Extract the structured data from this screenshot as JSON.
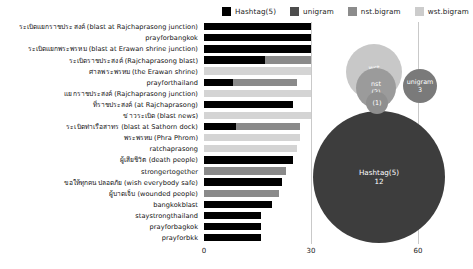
{
  "legend": {
    "items": [
      {
        "label": "Hashtag(5)",
        "color": "#000000",
        "icon": "legend-swatch-square"
      },
      {
        "label": "unigram",
        "color": "#4d4d4d",
        "icon": "legend-swatch-square"
      },
      {
        "label": "nst.bigram",
        "color": "#8c8c8c",
        "icon": "legend-swatch-square"
      },
      {
        "label": "wst.bigram",
        "color": "#cccccc",
        "icon": "legend-swatch-square"
      }
    ]
  },
  "chart_data": {
    "type": "bar",
    "orientation": "horizontal",
    "title": "",
    "xlabel": "",
    "ylabel": "",
    "xlim": [
      0,
      70
    ],
    "xticks": [
      0,
      30,
      60
    ],
    "xtick_labels": [
      "0",
      "30",
      "60"
    ],
    "grid": true,
    "legend_position": "top-right",
    "categories": [
      "ระเบิดแยกราชประสงค์ (blast at Rajchaprasong junction)",
      "prayforbangkok",
      "ระเบิดแยกพระพรหม (blast at Erawan shrine junction)",
      "ระเบิดราชประสงค์ (Rajchaprasong blast)",
      "ศาลพระพรหม (the Erawan shrine)",
      "prayforthailand",
      "แยกราชประสงค์ (Rajchaprasong junction)",
      "ที่ราชประสงค์ (at Rajchaprasong)",
      "ข่าวระเบิด (blast news)",
      "ระเบิดท่าเรือสาทร (blast at Sathorn dock)",
      "พระพรหม (Phra Phrom)",
      "ratchaprasong",
      "ผู้เสียชีวิต (death people)",
      "strongertogether",
      "ขอให้ทุกคนปลอดภัย (wish everybody safe)",
      "ผู้บาดเจ็บ (wounded people)",
      "bangkokblast",
      "staystrongthailand",
      "prayforbagkok",
      "prayforbkk"
    ],
    "values": [
      30,
      30,
      30,
      30,
      30,
      30,
      30,
      30,
      30,
      27,
      27,
      25,
      25,
      23,
      23,
      22,
      18,
      15,
      15,
      15
    ],
    "series_of_bar": [
      "wst.bigram",
      "Hashtag(5)",
      "wst.bigram",
      "wst.bigram",
      "nst.bigram",
      "Hashtag(5)",
      "nst.bigram",
      "wst.bigram",
      "wst.bigram",
      "Hashtag(5)",
      "unigram",
      "Hashtag(5)",
      "unigram",
      "Hashtag(5)",
      "Hashtag(5)",
      "unigram",
      "Hashtag(5)",
      "Hashtag(5)",
      "Hashtag(5)",
      "Hashtag(5)"
    ]
  },
  "bars": [
    {
      "label": "ระเบิดแยกราชประสงค์ (blast at Rajchaprasong junction)",
      "black_len": 30,
      "black_color": "#000000",
      "over_len": 30,
      "over_color": "#d4d4d4"
    },
    {
      "label": "prayforbangkok",
      "black_len": 30,
      "black_color": "#000000",
      "over_len": 30,
      "over_color": "#000000"
    },
    {
      "label": "ระเบิดแยกพระพรหม (blast at Erawan shrine junction)",
      "black_len": 30,
      "black_color": "#000000",
      "over_len": 30,
      "over_color": "#000000"
    },
    {
      "label": "ระเบิดราชประสงค์ (Rajchaprasong blast)",
      "black_len": 17,
      "black_color": "#000000",
      "over_len": 30,
      "over_color": "#8a8a8a"
    },
    {
      "label": "ศาลพระพรหม (the Erawan shrine)",
      "black_len": 0,
      "black_color": "#000000",
      "over_len": 30,
      "over_color": "#d4d4d4"
    },
    {
      "label": "prayforthailand",
      "black_len": 8,
      "black_color": "#000000",
      "over_len": 26,
      "over_color": "#8a8a8a"
    },
    {
      "label": "แยกราชประสงค์ (Rajchaprasong junction)",
      "black_len": 0,
      "black_color": "#000000",
      "over_len": 30,
      "over_color": "#d4d4d4"
    },
    {
      "label": "ที่ราชประสงค์ (at Rajchaprasong)",
      "black_len": 25,
      "black_color": "#000000",
      "over_len": 25,
      "over_color": "#000000"
    },
    {
      "label": "ข่าวระเบิด (blast news)",
      "black_len": 0,
      "black_color": "#000000",
      "over_len": 30,
      "over_color": "#d4d4d4"
    },
    {
      "label": "ระเบิดท่าเรือสาทร (blast at Sathorn dock)",
      "black_len": 9,
      "black_color": "#000000",
      "over_len": 27,
      "over_color": "#8a8a8a"
    },
    {
      "label": "พระพรหม (Phra Phrom)",
      "black_len": 0,
      "black_color": "#000000",
      "over_len": 27,
      "over_color": "#d4d4d4"
    },
    {
      "label": "ratchaprasong",
      "black_len": 0,
      "black_color": "#000000",
      "over_len": 26,
      "over_color": "#d4d4d4"
    },
    {
      "label": "ผู้เสียชีวิต (death people)",
      "black_len": 25,
      "black_color": "#000000",
      "over_len": 25,
      "over_color": "#000000"
    },
    {
      "label": "strongertogether",
      "black_len": 0,
      "black_color": "#000000",
      "over_len": 23,
      "over_color": "#8a8a8a"
    },
    {
      "label": "ขอให้ทุกคนปลอดภัย (wish everybody safe)",
      "black_len": 22,
      "black_color": "#000000",
      "over_len": 22,
      "over_color": "#000000"
    },
    {
      "label": "ผู้บาดเจ็บ (wounded people)",
      "black_len": 0,
      "black_color": "#000000",
      "over_len": 21,
      "over_color": "#8a8a8a"
    },
    {
      "label": "bangkokblast",
      "black_len": 19,
      "black_color": "#000000",
      "over_len": 19,
      "over_color": "#000000"
    },
    {
      "label": "staystrongthailand",
      "black_len": 16,
      "black_color": "#000000",
      "over_len": 16,
      "over_color": "#000000"
    },
    {
      "label": "prayforbagkok",
      "black_len": 16,
      "black_color": "#000000",
      "over_len": 16,
      "over_color": "#000000"
    },
    {
      "label": "prayforbkk",
      "black_len": 16,
      "black_color": "#000000",
      "over_len": 16,
      "over_color": "#000000"
    }
  ],
  "bubbles": [
    {
      "name": "wst",
      "value": "2",
      "color": "#c8c8c8",
      "text_color": "#ffffff"
    },
    {
      "name": "nst",
      "value": "(2)",
      "color": "#9b9b9b",
      "text_color": "#ffffff"
    },
    {
      "name": "",
      "value": "(1)",
      "color": "#8f8f8f",
      "text_color": "#ffffff"
    },
    {
      "name": "unigram",
      "value": "3",
      "color": "#7a7a7a",
      "text_color": "#ffffff"
    },
    {
      "name": "Hashtag(5)",
      "value": "12",
      "color": "#3d3d3d",
      "text_color": "#ffffff"
    }
  ]
}
